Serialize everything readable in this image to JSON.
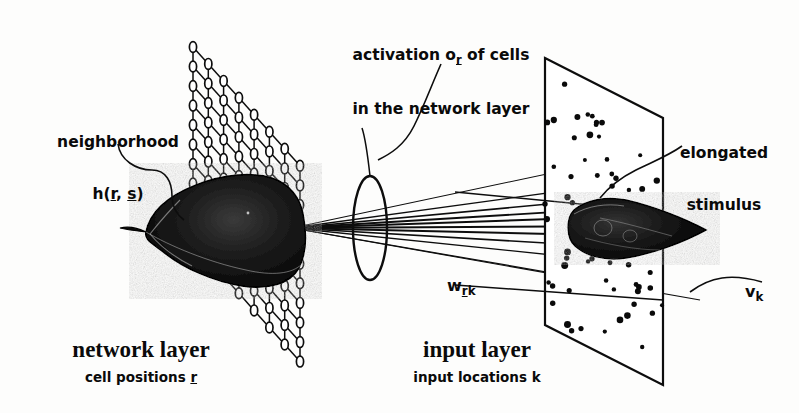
{
  "figure": {
    "kind": "neural-network-architecture-diagram",
    "background_color": "#fdfdfc",
    "ink_color": "#0a0a0a",
    "width": 799,
    "height": 413
  },
  "annotations": {
    "neighborhood": {
      "line1": "neighborhood",
      "line2_prefix": "h(",
      "line2_vec1": "r",
      "line2_mid": ", ",
      "line2_vec2": "s",
      "line2_suffix": ")"
    },
    "activation": {
      "line1_prefix": "activation o",
      "line1_sub": "r",
      "line1_suffix": " of cells",
      "line2": "in the network layer"
    },
    "stimulus": {
      "line1": "elongated",
      "line2": "stimulus"
    },
    "weights": {
      "symbol": "w",
      "sub_vec": "r",
      "sub_plain": "k"
    },
    "input_vector": {
      "symbol": "v",
      "sub_plain": "k"
    }
  },
  "layers": {
    "network": {
      "title": "network layer",
      "subtitle_prefix": "cell positions ",
      "subtitle_vec": "r",
      "lattice_type": "hexagonal-mesh",
      "lattice_rows": 11,
      "lattice_cols": 8
    },
    "input": {
      "title": "input layer",
      "subtitle": "input locations k",
      "dot_count": 62
    }
  },
  "elements": {
    "lens_label": "projection-lens",
    "connection_count": 9,
    "activation_blob_label": "activation-bump",
    "stimulus_blob_label": "elongated-stimulus-blob"
  }
}
